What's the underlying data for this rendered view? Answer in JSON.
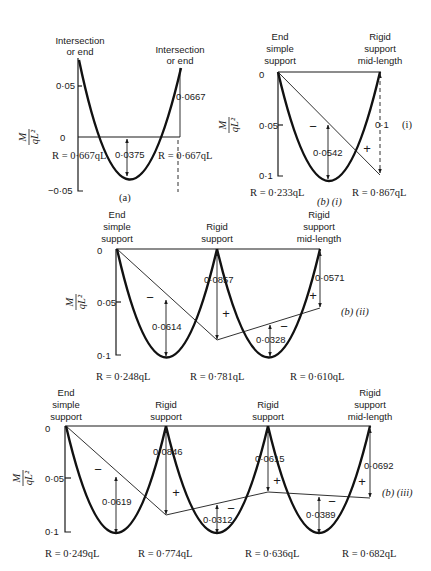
{
  "ylabel": {
    "num": "M",
    "den": "qL²"
  },
  "panel_a": {
    "caption": "(a)",
    "left_label": [
      "Intersection",
      "or end"
    ],
    "right_label": [
      "Intersection",
      "or end"
    ],
    "ticks": [
      "0·05",
      "0",
      "−0·05"
    ],
    "dim_mid": "0·0375",
    "dim_end": "0·0667",
    "reaction_left": "R = 0·667qL",
    "reaction_right": "R = 0·667qL"
  },
  "panel_b1": {
    "caption": "(b) (i)",
    "side_tag": "(i)",
    "left_label": [
      "End",
      "simple",
      "support"
    ],
    "right_label": [
      "Rigid",
      "support",
      "mid-length"
    ],
    "ticks": [
      "0",
      "0·05",
      "0·1"
    ],
    "dim_span": "0·0542",
    "dim_end": "0·1",
    "sign_minus": "−",
    "sign_plus": "+",
    "reaction_left": "R = 0·233qL",
    "reaction_right": "R = 0·867qL"
  },
  "panel_b2": {
    "caption": "(b) (ii)",
    "labels": [
      [
        "End",
        "simple",
        "support"
      ],
      [
        "Rigid",
        "support"
      ],
      [
        "Rigid",
        "support",
        "mid-length"
      ]
    ],
    "ticks": [
      "0",
      "0·05",
      "0·1"
    ],
    "dim_span1": "0·0614",
    "dim_support": "0·0857",
    "dim_span2": "0·0328",
    "dim_end": "0·0571",
    "reactions": [
      "R = 0·248qL",
      "R = 0·781qL",
      "R = 0·610qL"
    ]
  },
  "panel_b3": {
    "caption": "(b) (iii)",
    "labels": [
      [
        "End",
        "simple",
        "support"
      ],
      [
        "Rigid",
        "support"
      ],
      [
        "Rigid",
        "support"
      ],
      [
        "Rigid",
        "support",
        "mid-length"
      ]
    ],
    "ticks": [
      "0",
      "0·05",
      "0·1"
    ],
    "dim_span1": "0·0619",
    "dim_support1": "0·0846",
    "dim_span2": "0·0312",
    "dim_support2": "0·0615",
    "dim_span3": "0·0389",
    "dim_end": "0·0692",
    "reactions": [
      "R = 0·249qL",
      "R = 0·774qL",
      "R = 0·636qL",
      "R = 0·682qL"
    ]
  }
}
